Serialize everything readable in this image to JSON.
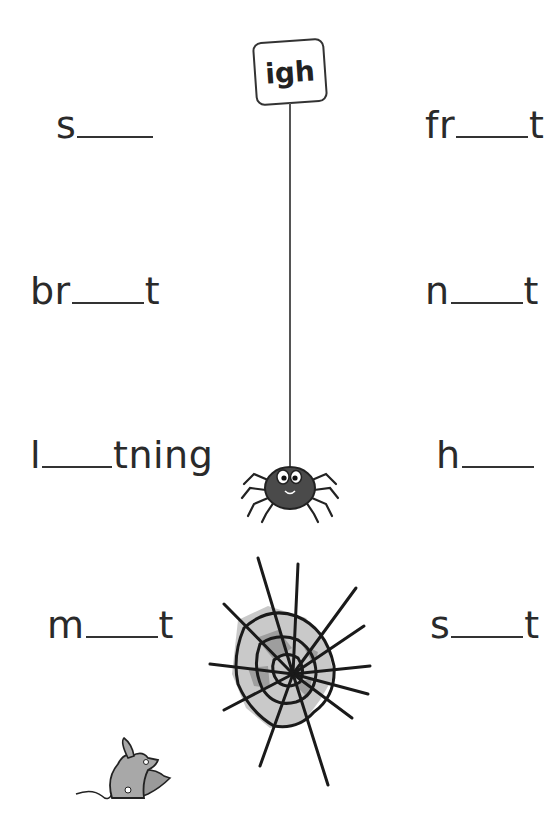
{
  "sign": {
    "label": "igh"
  },
  "words": {
    "left": [
      {
        "prefix": "s",
        "suffix": ""
      },
      {
        "prefix": "br",
        "suffix": "t"
      },
      {
        "prefix": "l",
        "suffix": "tning"
      },
      {
        "prefix": "m",
        "suffix": "t"
      }
    ],
    "right": [
      {
        "prefix": "fr",
        "suffix": "t"
      },
      {
        "prefix": "n",
        "suffix": "t"
      },
      {
        "prefix": "h",
        "suffix": ""
      },
      {
        "prefix": "s",
        "suffix": "t"
      }
    ]
  }
}
